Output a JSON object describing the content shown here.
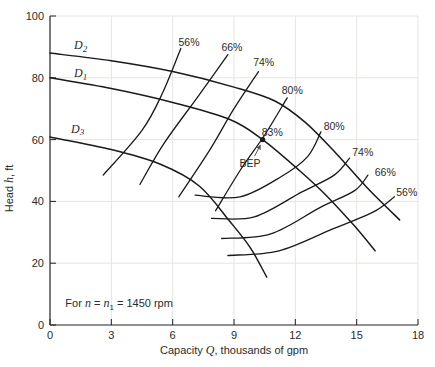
{
  "chart_data": {
    "type": "line",
    "title": "",
    "xlabel_parts": [
      {
        "t": "Capacity ",
        "style": "normal"
      },
      {
        "t": "Q",
        "style": "italic"
      },
      {
        "t": ", thousands of gpm",
        "style": "normal"
      }
    ],
    "ylabel_parts": [
      {
        "t": "Head ",
        "style": "normal"
      },
      {
        "t": "h",
        "style": "italic"
      },
      {
        "t": ", ft",
        "style": "normal"
      }
    ],
    "xlim": [
      0,
      18
    ],
    "ylim": [
      0,
      100
    ],
    "xticks": [
      0,
      3,
      6,
      9,
      12,
      15,
      18
    ],
    "yticks": [
      0,
      20,
      40,
      60,
      80,
      100
    ],
    "grid": true,
    "annotation": {
      "q": 0.75,
      "h": 7,
      "segments": [
        {
          "t": "For ",
          "style": "normal"
        },
        {
          "t": "n",
          "style": "italic"
        },
        {
          "t": " = ",
          "style": "normal"
        },
        {
          "t": "n",
          "style": "italic"
        },
        {
          "t": "1",
          "style": "sub"
        },
        {
          "t": " = 1450 rpm",
          "style": "normal"
        }
      ]
    },
    "pump_curves": [
      {
        "name": "D2",
        "label": {
          "text": "D",
          "sub": "2"
        },
        "label_q": 1.5,
        "label_h": 90.5,
        "points": [
          [
            0,
            88
          ],
          [
            3,
            85.5
          ],
          [
            6,
            82
          ],
          [
            9,
            77
          ],
          [
            11,
            72.5
          ],
          [
            12.5,
            65.5
          ],
          [
            14,
            55.5
          ],
          [
            15.5,
            44.5
          ],
          [
            17.1,
            34
          ]
        ]
      },
      {
        "name": "D1",
        "label": {
          "text": "D",
          "sub": "1"
        },
        "label_q": 1.5,
        "label_h": 81.5,
        "points": [
          [
            0,
            80
          ],
          [
            3,
            76.5
          ],
          [
            6,
            72
          ],
          [
            8.8,
            66.5
          ],
          [
            10.4,
            60
          ],
          [
            12.2,
            50
          ],
          [
            13.5,
            42
          ],
          [
            14.9,
            32
          ],
          [
            15.9,
            24
          ]
        ]
      },
      {
        "name": "D3",
        "label": {
          "text": "D",
          "sub": "3"
        },
        "label_q": 1.35,
        "label_h": 63.5,
        "points": [
          [
            0,
            60.8
          ],
          [
            3,
            56.8
          ],
          [
            5.4,
            52
          ],
          [
            7.3,
            45
          ],
          [
            8.8,
            33.5
          ],
          [
            9.8,
            25
          ],
          [
            10.6,
            15.5
          ]
        ]
      }
    ],
    "efficiency_curves": [
      {
        "label": "56%",
        "side": "top",
        "label_q": 6.8,
        "label_h": 91.5,
        "points": [
          [
            2.6,
            48.5
          ],
          [
            4.5,
            63
          ],
          [
            5.5,
            75
          ],
          [
            6.4,
            89.5
          ]
        ]
      },
      {
        "label": "66%",
        "side": "top",
        "label_q": 8.9,
        "label_h": 90,
        "points": [
          [
            4.4,
            45.5
          ],
          [
            5.6,
            59
          ],
          [
            7.3,
            74.5
          ],
          [
            8.7,
            87.5
          ]
        ]
      },
      {
        "label": "74%",
        "side": "top",
        "label_q": 10.45,
        "label_h": 85,
        "points": [
          [
            6.3,
            41.5
          ],
          [
            7.8,
            56.5
          ],
          [
            9.0,
            70
          ],
          [
            10.2,
            82
          ]
        ]
      },
      {
        "label": "80%",
        "side": "top",
        "label_q": 11.85,
        "label_h": 76,
        "points": [
          [
            8.1,
            37
          ],
          [
            9.3,
            50
          ],
          [
            10.5,
            61.5
          ],
          [
            11.6,
            73.5
          ]
        ]
      },
      {
        "label": "80%",
        "side": "right",
        "label_q": 13.9,
        "label_h": 64.5,
        "points": [
          [
            7.1,
            42
          ],
          [
            9.3,
            41.5
          ],
          [
            11.3,
            48
          ],
          [
            12.6,
            54.5
          ],
          [
            13.25,
            62.5
          ]
        ]
      },
      {
        "label": "74%",
        "side": "right",
        "label_q": 15.3,
        "label_h": 56,
        "points": [
          [
            7.9,
            34.5
          ],
          [
            10,
            35
          ],
          [
            12.3,
            43
          ],
          [
            13.9,
            48.5
          ],
          [
            14.65,
            54
          ]
        ]
      },
      {
        "label": "66%",
        "side": "right",
        "label_q": 16.4,
        "label_h": 49.5,
        "points": [
          [
            8.4,
            28
          ],
          [
            10.8,
            29.5
          ],
          [
            13.2,
            38
          ],
          [
            14.9,
            43.5
          ],
          [
            15.55,
            48.5
          ]
        ]
      },
      {
        "label": "56%",
        "side": "right",
        "label_q": 17.45,
        "label_h": 43,
        "points": [
          [
            8.7,
            22.5
          ],
          [
            11.2,
            24
          ],
          [
            13.8,
            31
          ],
          [
            15.8,
            36.5
          ],
          [
            16.85,
            41.5
          ]
        ]
      }
    ],
    "bep": {
      "q": 10.4,
      "h": 60,
      "value_label": "83%",
      "value_q": 10.87,
      "value_h": 62.5,
      "text": "BEP",
      "text_q": 9.78,
      "text_h": 52.5,
      "arrow": {
        "from": [
          10.0,
          54.6
        ],
        "to": [
          10.3,
          58.3
        ]
      }
    },
    "colors": {
      "curve": "#1a1a1a",
      "axis": "#222222",
      "grid": "#e7e4e0",
      "text": "#2b2b2b"
    }
  }
}
